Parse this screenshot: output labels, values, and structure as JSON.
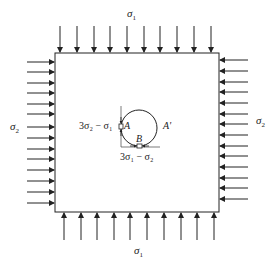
{
  "diagram": {
    "type": "biaxial compression plate with circular hole",
    "labels": {
      "top_stress": "σ",
      "top_stress_sub": "1",
      "bottom_stress": "σ",
      "bottom_stress_sub": "1",
      "left_stress": "σ",
      "left_stress_sub": "2",
      "right_stress": "σ",
      "right_stress_sub": "2",
      "point_a": "A",
      "point_a_prime": "A'",
      "point_b": "B",
      "stress_at_a": "3σ₂ − σ₁",
      "stress_at_b": "3σ₁ − σ₂"
    },
    "arrows": {
      "top_count": 10,
      "bottom_count": 10,
      "left_count": 14,
      "right_count": 14
    },
    "colors": {
      "line": "#222222",
      "background": "#ffffff"
    }
  }
}
